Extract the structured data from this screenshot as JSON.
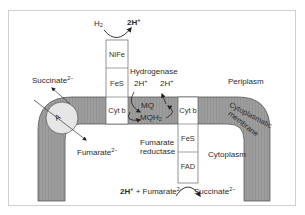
{
  "figure": {
    "type": "membrane electron transport diagram",
    "colors": {
      "membrane_fill": "#9a9a9a",
      "membrane_edge": "#555555",
      "protein_fill": "#ffffff",
      "transporter_fill": "#e8e8e8",
      "frame_border": "#cfcfcf"
    }
  },
  "compartments": {
    "periplasm": "Periplasm",
    "cytoplasm": "Cytoplasm",
    "membrane_line1": "Cytoplasmatic",
    "membrane_line2": "membrane"
  },
  "hydrogenase": {
    "name": "Hydrogenase",
    "subunits": [
      "NiFe",
      "FeS",
      "Cyt b"
    ],
    "substrate": "H",
    "substrate_sub": "2",
    "product": "2H",
    "product_sup": "+"
  },
  "quinone": {
    "oxidized": "MQ",
    "reduced": "MQH",
    "reduced_sub": "2",
    "proton_left": "2H",
    "proton_left_sup": "+",
    "proton_right": "2H",
    "proton_right_sup": "+"
  },
  "fumarate_reductase": {
    "name_line1": "Fumarate",
    "name_line2": "reductase",
    "subunits": [
      "Cyt b",
      "FeS",
      "FAD"
    ],
    "reaction_protons": "2H",
    "reaction_protons_sup": "+",
    "reaction_plus": " + ",
    "substrate": "Fumarate",
    "substrate_sup": "2−",
    "product": "Succinate",
    "product_sup": "2−"
  },
  "antiporter": {
    "label": "A",
    "outward": "Succinate",
    "outward_sup": "2−",
    "inward": "Fumarate",
    "inward_sup": "2−"
  }
}
